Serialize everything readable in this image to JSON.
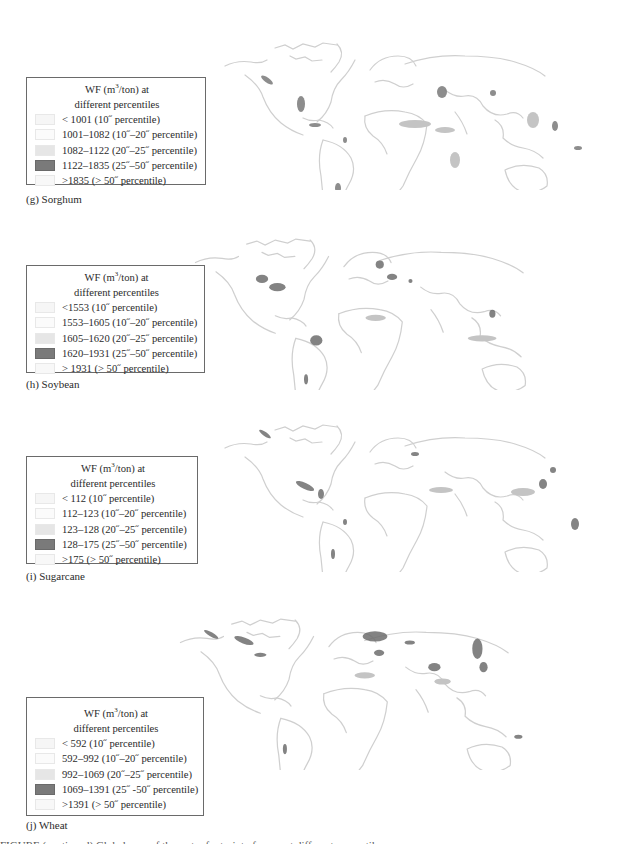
{
  "figure": {
    "swatch_colors": [
      "#f6f6f6",
      "#fbfbfb",
      "#e6e6e6",
      "#7a7a7a",
      "#f8f8f8"
    ],
    "map_shade_light": "#c9c9c9",
    "map_shade_dark": "#6e6e6e",
    "panels": [
      {
        "id": "g",
        "caption": "(g) Sorghum",
        "legend": {
          "title_line1_pre": "WF (m",
          "title_sup": "3",
          "title_line1_post": "/ton) at",
          "title_line2": "different percentiles",
          "items": [
            {
              "label": "< 1001 (10˝ percentile)"
            },
            {
              "label": "1001–1082 (10˝–20˝ percentile)"
            },
            {
              "label": "1082–1122 (20˝–25˝ percentile)"
            },
            {
              "label": "1122–1835 (25˝–50˝ percentile)"
            },
            {
              "label": ">1835 (> 50˝ percentile)"
            }
          ]
        }
      },
      {
        "id": "h",
        "caption": "(h) Soybean",
        "legend": {
          "title_line1_pre": "WF (m",
          "title_sup": "3",
          "title_line1_post": "/ton) at",
          "title_line2": "different percentiles",
          "items": [
            {
              "label": "<1553 (10˝ percentile)"
            },
            {
              "label": "1553–1605 (10˝–20˝ percentile)"
            },
            {
              "label": "1605–1620 (20˝–25˝ percentile)"
            },
            {
              "label": "1620–1931 (25˝–50˝ percentile)"
            },
            {
              "label": "> 1931 (> 50˝ percentile)"
            }
          ]
        }
      },
      {
        "id": "i",
        "caption": "(i) Sugarcane",
        "legend": {
          "title_line1_pre": "WF (m",
          "title_sup": "3",
          "title_line1_post": "/ton) at",
          "title_line2": "different percentiles",
          "items": [
            {
              "label": "< 112 (10˝ percentile)"
            },
            {
              "label": "112–123 (10˝–20˝ percentile)"
            },
            {
              "label": "123–128 (20˝–25˝ percentile)"
            },
            {
              "label": "128–175 (25˝–50˝ percentile)"
            },
            {
              "label": ">175 (> 50˝ percentile)"
            }
          ]
        }
      },
      {
        "id": "j",
        "caption": "(j) Wheat",
        "legend": {
          "title_line1_pre": "WF (m",
          "title_sup": "3",
          "title_line1_post": "/ton) at",
          "title_line2": "different percentiles",
          "items": [
            {
              "label": "< 592 (10˝ percentile)"
            },
            {
              "label": "592–992 (10˝–20˝ percentile)"
            },
            {
              "label": "992–1069 (20˝–25˝ percentile)"
            },
            {
              "label": "1069–1391 (25˝ -50˝ percentile)"
            },
            {
              "label": ">1391 (> 50˝ percentile)"
            }
          ]
        }
      }
    ],
    "bottom_caption_fragment": "FIGURE (continued) Global map of the water footprint of crops at different percentiles"
  }
}
